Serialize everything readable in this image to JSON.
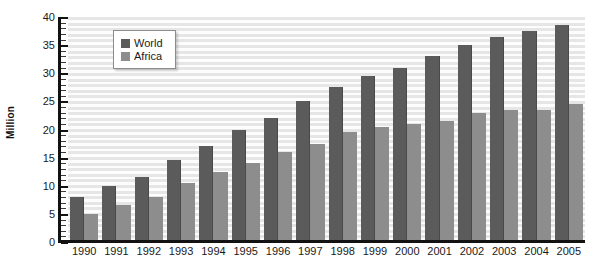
{
  "chart_data": {
    "type": "bar",
    "title": "",
    "subtitle": "",
    "xlabel": "",
    "ylabel": "Million",
    "ylim": [
      0,
      40
    ],
    "y_ticks": [
      40,
      35,
      30,
      25,
      20,
      15,
      10,
      5,
      0
    ],
    "y_minor_tick_step": 1,
    "grid": true,
    "legend_position": "inside-top-left",
    "categories": [
      "1990",
      "1991",
      "1992",
      "1993",
      "1994",
      "1995",
      "1996",
      "1997",
      "1998",
      "1999",
      "2000",
      "2001",
      "2002",
      "2003",
      "2004",
      "2005"
    ],
    "series": [
      {
        "name": "World",
        "color": "#5b5b5b",
        "values": [
          8,
          10,
          11.5,
          14.5,
          17,
          20,
          22,
          25,
          27.5,
          29.5,
          31,
          33,
          35,
          36.5,
          37.5,
          38.5
        ]
      },
      {
        "name": "Africa",
        "color": "#8d8d8d",
        "values": [
          5,
          6.5,
          8,
          10.5,
          12.5,
          14,
          16,
          17.5,
          19.5,
          20.5,
          21,
          21.5,
          23,
          23.5,
          23.5,
          24.5
        ]
      }
    ]
  },
  "legend": {
    "items": [
      {
        "label": "World",
        "color": "#5b5b5b"
      },
      {
        "label": "Africa",
        "color": "#8d8d8d"
      }
    ]
  },
  "axes": {
    "y_title": "Million"
  }
}
